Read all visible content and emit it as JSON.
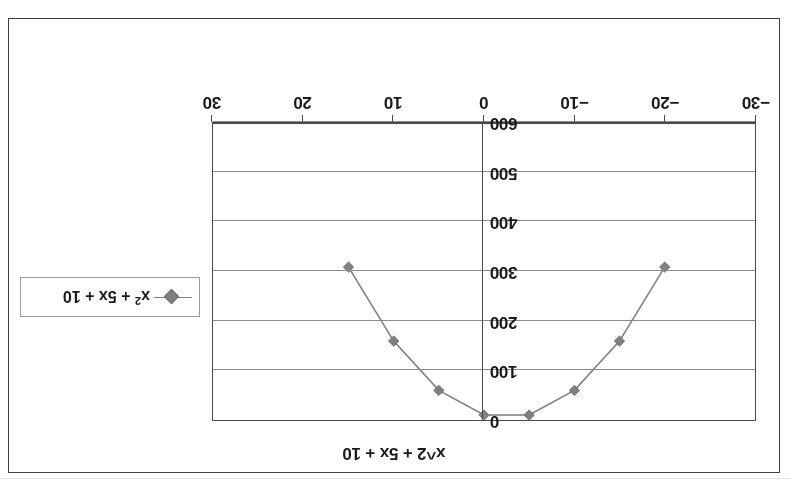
{
  "chart_data": {
    "type": "line",
    "title": "x^2 + 5x + 10",
    "xlabel": "",
    "ylabel": "",
    "legend": [
      "x² + 5x + 10"
    ],
    "legend_position": "middle-left",
    "grid": true,
    "orientation_note": "chart rendered rotated 180 degrees",
    "x_ticks": [
      -30,
      -20,
      -10,
      0,
      10,
      20,
      30
    ],
    "x_tick_labels": [
      "−30",
      "−20",
      "−10",
      "0",
      "10",
      "20",
      "30"
    ],
    "xlim": [
      -30,
      30
    ],
    "y_ticks": [
      0,
      100,
      200,
      300,
      400,
      500,
      600
    ],
    "y_tick_labels": [
      "0",
      "100",
      "200",
      "300",
      "400",
      "500",
      "600"
    ],
    "ylim": [
      0,
      600
    ],
    "y_axis_inverted": true,
    "series": [
      {
        "name": "x² + 5x + 10",
        "marker": "diamond",
        "marker_color": "#808080",
        "line_color": "#7f7f7f",
        "x": [
          -20,
          -15,
          -10,
          -5,
          0,
          5,
          10,
          15
        ],
        "y": [
          310,
          160,
          60,
          10,
          10,
          60,
          160,
          310
        ],
        "points": [
          {
            "x": -20,
            "y": 310
          },
          {
            "x": -15,
            "y": 160
          },
          {
            "x": -10,
            "y": 60
          },
          {
            "x": -5,
            "y": 10
          },
          {
            "x": 0,
            "y": 10
          },
          {
            "x": 5,
            "y": 60
          },
          {
            "x": 10,
            "y": 160
          },
          {
            "x": 15,
            "y": 310
          }
        ]
      }
    ]
  },
  "chart": {
    "title": "x^2 + 5x + 10",
    "legend_label": "x² + 5x + 10",
    "legend_label_base": "x",
    "legend_label_sup": "2",
    "legend_label_rest": " + 5x + 10",
    "x_tick_labels": [
      "−30",
      "−20",
      "−10",
      "0",
      "10",
      "20",
      "30"
    ],
    "y_tick_labels": [
      "0",
      "100",
      "200",
      "300",
      "400",
      "500",
      "600"
    ]
  },
  "colors": {
    "frame": "#3f3f3f",
    "plot_border": "#4a4a4a",
    "gridline": "#8a8a8a",
    "series": "#7f7f7f",
    "marker": "#808080",
    "text": "#1a1a1a",
    "background": "#ffffff"
  }
}
